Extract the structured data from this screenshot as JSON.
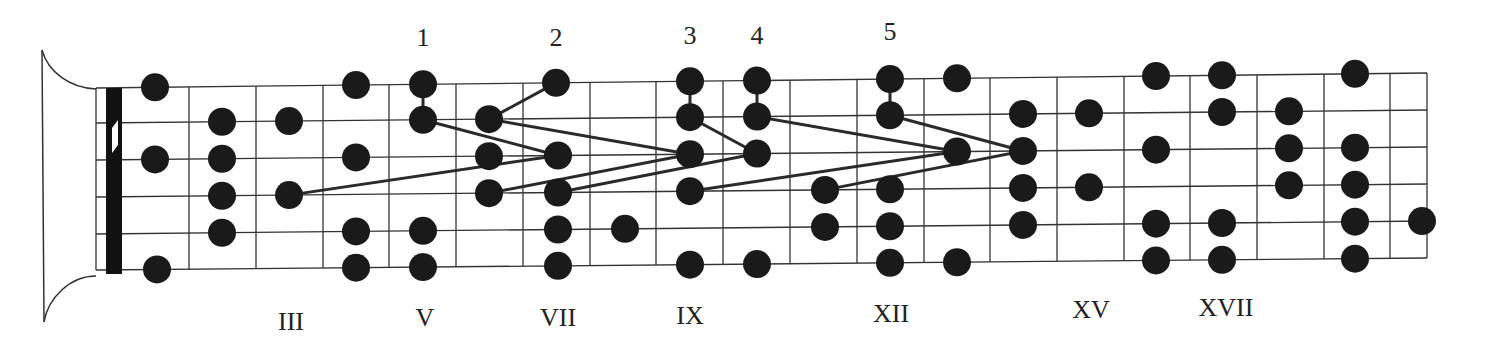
{
  "diagram": {
    "strings": 6,
    "colors": {
      "dot": "#1a1a1a",
      "line": "#333333",
      "nut": "#111111",
      "background": "#ffffff"
    },
    "shape_labels": [
      {
        "text": "1",
        "x": 423,
        "y": 46
      },
      {
        "text": "2",
        "x": 556,
        "y": 46
      },
      {
        "text": "3",
        "x": 690,
        "y": 44
      },
      {
        "text": "4",
        "x": 757,
        "y": 44
      },
      {
        "text": "5",
        "x": 890,
        "y": 40
      }
    ],
    "position_markers": [
      {
        "text": "III",
        "x": 291,
        "y": 330
      },
      {
        "text": "V",
        "x": 425,
        "y": 326
      },
      {
        "text": "VII",
        "x": 558,
        "y": 326
      },
      {
        "text": "IX",
        "x": 690,
        "y": 324
      },
      {
        "text": "XII",
        "x": 891,
        "y": 322
      },
      {
        "text": "XV",
        "x": 1091,
        "y": 318
      },
      {
        "text": "XVII",
        "x": 1226,
        "y": 316
      }
    ]
  }
}
